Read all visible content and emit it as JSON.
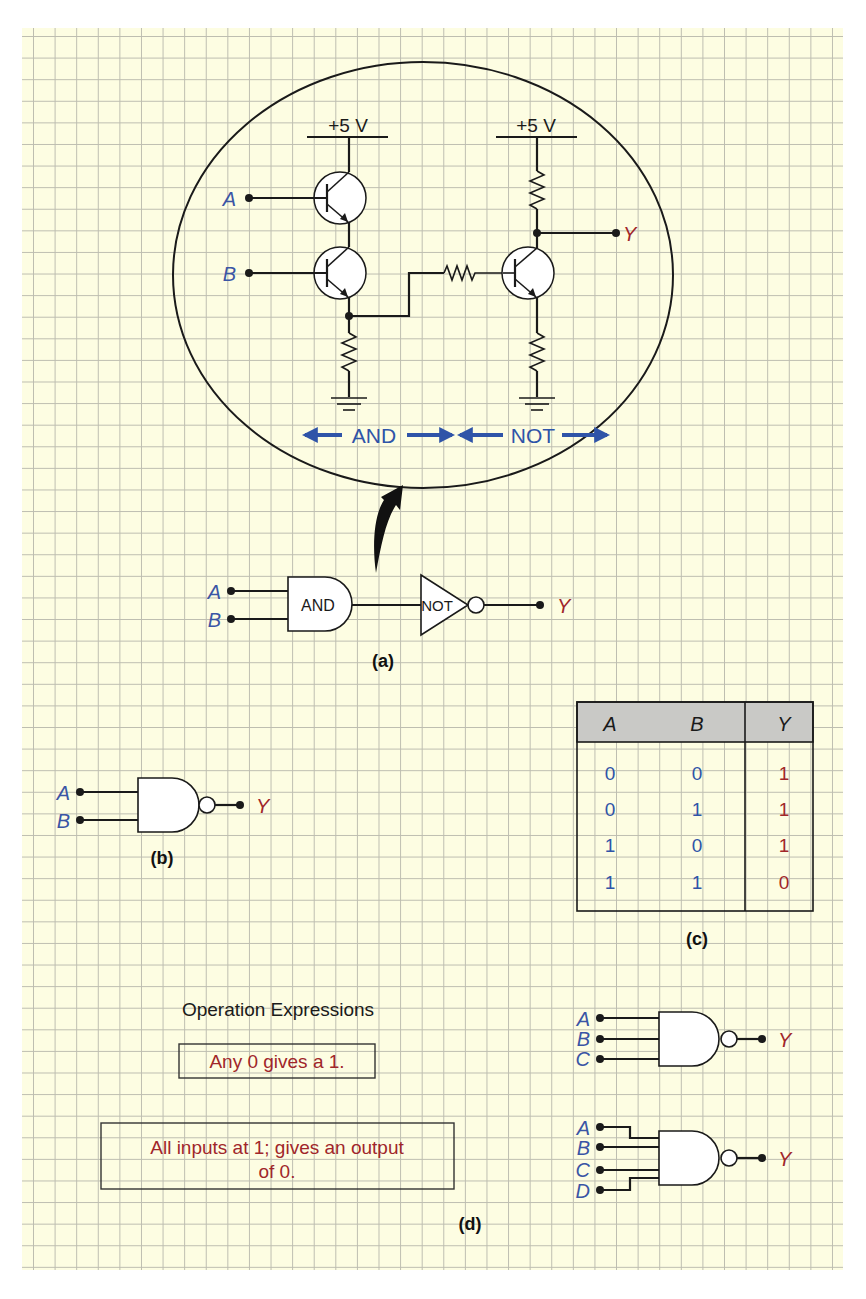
{
  "colors": {
    "paper": "#fdfde2",
    "grid": "#bdbdb0",
    "input_label": "#3a55a5",
    "output_label": "#a0262a",
    "arrow_label": "#2f54a8",
    "table_header": "#c9c9c6",
    "wire": "#1a1a1a"
  },
  "panel_a": {
    "caption": "(a)",
    "circuit": {
      "supply_left": "+5 V",
      "supply_right": "+5 V",
      "input_a": "A",
      "input_b": "B",
      "output_y": "Y",
      "section_and": "AND",
      "section_not": "NOT"
    },
    "logic": {
      "input_a": "A",
      "input_b": "B",
      "and_gate_label": "AND",
      "not_gate_label": "NOT",
      "output_y": "Y"
    }
  },
  "panel_b": {
    "caption": "(b)",
    "input_a": "A",
    "input_b": "B",
    "output_y": "Y"
  },
  "panel_c": {
    "caption": "(c)",
    "headers": [
      "A",
      "B",
      "Y"
    ],
    "rows": [
      [
        "0",
        "0",
        "1"
      ],
      [
        "0",
        "1",
        "1"
      ],
      [
        "1",
        "0",
        "1"
      ],
      [
        "1",
        "1",
        "0"
      ]
    ]
  },
  "panel_d": {
    "caption": "(d)",
    "title": "Operation Expressions",
    "expression_1": "Any 0 gives a 1.",
    "expression_2_line1": "All inputs at 1;  gives an output",
    "expression_2_line2": "of 0.",
    "gate3": {
      "inputs": [
        "A",
        "B",
        "C"
      ],
      "output": "Y"
    },
    "gate4": {
      "inputs": [
        "A",
        "B",
        "C",
        "D"
      ],
      "output": "Y"
    }
  }
}
